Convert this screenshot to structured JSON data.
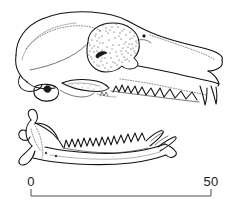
{
  "figure": {
    "kind": "scientific-line-drawing",
    "background_color": "#ffffff",
    "ink_color": "#111111",
    "stipple_color": "#2a2a2a"
  },
  "scale_bar": {
    "name": "scale-bar",
    "left_label": "0",
    "right_label": "50",
    "left_value": 0,
    "right_value": 50,
    "bar_left_x": 31,
    "bar_right_x": 211,
    "bar_y": 196,
    "tick_height": 7,
    "rule_color": "#4a4a4a",
    "label_color": "#1a1a1a"
  },
  "parts": {
    "cranium": "cranium",
    "orbit": "orbit-stippled",
    "rostrum": "rostrum",
    "zygomatic_arch": "zygomatic-arch",
    "upper_toothrow": "upper-toothrow",
    "upper_canine": "upper-canine",
    "occipital": "occipital-region",
    "auditory_bulla": "auditory-bulla",
    "mandible": "mandible",
    "coronoid_process": "coronoid-process",
    "condyle": "mandibular-condyle",
    "angular_process": "angular-process",
    "lower_toothrow": "lower-toothrow"
  }
}
